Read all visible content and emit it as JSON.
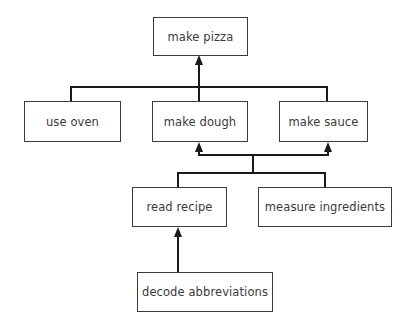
{
  "diagram": {
    "type": "goal-decomposition-tree",
    "colors": {
      "line": "#1a1a1a",
      "box_border": "#3a3a3a",
      "text": "#3a3a3a",
      "background": "#ffffff"
    },
    "nodes": [
      {
        "id": "make_pizza",
        "label": "make pizza"
      },
      {
        "id": "use_oven",
        "label": "use oven"
      },
      {
        "id": "make_dough",
        "label": "make dough"
      },
      {
        "id": "make_sauce",
        "label": "make sauce"
      },
      {
        "id": "read_recipe",
        "label": "read recipe"
      },
      {
        "id": "measure_ingredients",
        "label": "measure ingredients"
      },
      {
        "id": "decode_abbreviations",
        "label": "decode abbreviations"
      }
    ],
    "edges": [
      {
        "from": [
          "use_oven",
          "make_dough",
          "make_sauce"
        ],
        "to": "make_pizza"
      },
      {
        "from": [
          "read_recipe",
          "measure_ingredients"
        ],
        "to": [
          "make_dough",
          "make_sauce"
        ]
      },
      {
        "from": "decode_abbreviations",
        "to": "read_recipe"
      }
    ]
  }
}
